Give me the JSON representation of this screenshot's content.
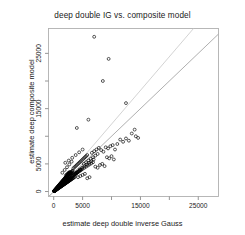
{
  "chart_data": {
    "type": "scatter",
    "title": "deep double IG vs. composite model",
    "xlabel": "estimate deep double inverse Gauss",
    "ylabel": "estimate deep composite model",
    "xlim": [
      -900,
      28500
    ],
    "ylim": [
      -900,
      29500
    ],
    "grid": false,
    "legend": null,
    "marker": "open-circle",
    "marker_color": "#000000",
    "xticks": [
      0,
      5000,
      10000,
      15000,
      20000,
      25000
    ],
    "xtick_labels": [
      "0",
      "5000",
      "",
      "15000",
      "",
      "25000"
    ],
    "yticks": [
      0,
      5000,
      10000,
      15000,
      20000,
      25000
    ],
    "ytick_labels": [
      "0",
      "5000",
      "",
      "15000",
      "",
      "25000"
    ],
    "reference_lines": [
      {
        "name": "identity-line",
        "slope": 1.0,
        "intercept": 0,
        "color": "#9a9a9a"
      },
      {
        "name": "fit-line",
        "slope": 1.22,
        "intercept": 0,
        "color": "#c8c8c8"
      }
    ],
    "points": [
      [
        60,
        55
      ],
      [
        90,
        80
      ],
      [
        110,
        95
      ],
      [
        130,
        120
      ],
      [
        150,
        130
      ],
      [
        170,
        160
      ],
      [
        190,
        175
      ],
      [
        210,
        195
      ],
      [
        230,
        210
      ],
      [
        250,
        235
      ],
      [
        270,
        250
      ],
      [
        290,
        265
      ],
      [
        310,
        290
      ],
      [
        330,
        300
      ],
      [
        350,
        325
      ],
      [
        370,
        340
      ],
      [
        390,
        360
      ],
      [
        410,
        380
      ],
      [
        430,
        395
      ],
      [
        450,
        415
      ],
      [
        470,
        430
      ],
      [
        490,
        455
      ],
      [
        510,
        470
      ],
      [
        530,
        490
      ],
      [
        550,
        505
      ],
      [
        570,
        525
      ],
      [
        590,
        545
      ],
      [
        610,
        560
      ],
      [
        630,
        580
      ],
      [
        650,
        600
      ],
      [
        670,
        615
      ],
      [
        690,
        635
      ],
      [
        710,
        650
      ],
      [
        730,
        670
      ],
      [
        750,
        690
      ],
      [
        770,
        705
      ],
      [
        790,
        725
      ],
      [
        810,
        745
      ],
      [
        830,
        760
      ],
      [
        850,
        780
      ],
      [
        870,
        800
      ],
      [
        890,
        815
      ],
      [
        910,
        835
      ],
      [
        930,
        855
      ],
      [
        950,
        870
      ],
      [
        970,
        890
      ],
      [
        990,
        910
      ],
      [
        1010,
        925
      ],
      [
        1030,
        945
      ],
      [
        1050,
        965
      ],
      [
        1080,
        985
      ],
      [
        1110,
        1010
      ],
      [
        1140,
        1035
      ],
      [
        1170,
        1060
      ],
      [
        1200,
        1085
      ],
      [
        1230,
        1110
      ],
      [
        1260,
        1140
      ],
      [
        1290,
        1165
      ],
      [
        1320,
        1190
      ],
      [
        1350,
        1215
      ],
      [
        1380,
        1240
      ],
      [
        1410,
        1265
      ],
      [
        1440,
        1290
      ],
      [
        1470,
        1320
      ],
      [
        1500,
        1345
      ],
      [
        1530,
        1370
      ],
      [
        1560,
        1395
      ],
      [
        1590,
        1420
      ],
      [
        1620,
        1445
      ],
      [
        1650,
        1470
      ],
      [
        1690,
        1500
      ],
      [
        1730,
        1530
      ],
      [
        1770,
        1560
      ],
      [
        1810,
        1590
      ],
      [
        1850,
        1620
      ],
      [
        1890,
        1650
      ],
      [
        1930,
        1680
      ],
      [
        1970,
        1710
      ],
      [
        2010,
        1740
      ],
      [
        2050,
        1775
      ],
      [
        2090,
        1805
      ],
      [
        2130,
        1835
      ],
      [
        2170,
        1865
      ],
      [
        2210,
        1895
      ],
      [
        2250,
        1925
      ],
      [
        2300,
        1960
      ],
      [
        2350,
        1995
      ],
      [
        2400,
        2030
      ],
      [
        2450,
        2070
      ],
      [
        2500,
        2105
      ],
      [
        2550,
        2140
      ],
      [
        2600,
        2175
      ],
      [
        2650,
        2215
      ],
      [
        2700,
        2250
      ],
      [
        2750,
        2285
      ],
      [
        2800,
        2320
      ],
      [
        2850,
        2360
      ],
      [
        2900,
        2395
      ],
      [
        2950,
        2430
      ],
      [
        3000,
        2470
      ],
      [
        120,
        150
      ],
      [
        200,
        245
      ],
      [
        280,
        340
      ],
      [
        360,
        435
      ],
      [
        440,
        530
      ],
      [
        520,
        625
      ],
      [
        600,
        720
      ],
      [
        680,
        815
      ],
      [
        760,
        910
      ],
      [
        840,
        1005
      ],
      [
        920,
        1100
      ],
      [
        1000,
        1195
      ],
      [
        1080,
        1290
      ],
      [
        1160,
        1385
      ],
      [
        1240,
        1480
      ],
      [
        1320,
        1575
      ],
      [
        1400,
        1670
      ],
      [
        1480,
        1765
      ],
      [
        1560,
        1860
      ],
      [
        1640,
        1955
      ],
      [
        1720,
        2050
      ],
      [
        1800,
        2145
      ],
      [
        1880,
        2240
      ],
      [
        1960,
        2335
      ],
      [
        2040,
        2430
      ],
      [
        2120,
        2525
      ],
      [
        2200,
        2620
      ],
      [
        2280,
        2715
      ],
      [
        2360,
        2810
      ],
      [
        2440,
        2905
      ],
      [
        2520,
        3000
      ],
      [
        2600,
        3095
      ],
      [
        2700,
        3190
      ],
      [
        2800,
        3290
      ],
      [
        2900,
        3390
      ],
      [
        3000,
        3490
      ],
      [
        3100,
        3590
      ],
      [
        3200,
        3690
      ],
      [
        3300,
        3790
      ],
      [
        150,
        110
      ],
      [
        250,
        180
      ],
      [
        350,
        255
      ],
      [
        450,
        325
      ],
      [
        550,
        400
      ],
      [
        650,
        470
      ],
      [
        750,
        545
      ],
      [
        850,
        615
      ],
      [
        950,
        690
      ],
      [
        1050,
        760
      ],
      [
        1150,
        835
      ],
      [
        1250,
        905
      ],
      [
        1350,
        980
      ],
      [
        1450,
        1050
      ],
      [
        1550,
        1125
      ],
      [
        1650,
        1195
      ],
      [
        1750,
        1270
      ],
      [
        1850,
        1340
      ],
      [
        1950,
        1415
      ],
      [
        2050,
        1485
      ],
      [
        2150,
        1560
      ],
      [
        2250,
        1630
      ],
      [
        2350,
        1705
      ],
      [
        2450,
        1775
      ],
      [
        2550,
        1850
      ],
      [
        2650,
        1920
      ],
      [
        2750,
        1995
      ],
      [
        2850,
        2065
      ],
      [
        2950,
        2140
      ],
      [
        3050,
        2210
      ],
      [
        3150,
        2285
      ],
      [
        3250,
        2355
      ],
      [
        3350,
        2430
      ],
      [
        3500,
        2530
      ],
      [
        3650,
        2640
      ],
      [
        100,
        70
      ],
      [
        180,
        130
      ],
      [
        260,
        190
      ],
      [
        340,
        250
      ],
      [
        420,
        310
      ],
      [
        500,
        370
      ],
      [
        580,
        430
      ],
      [
        660,
        490
      ],
      [
        740,
        550
      ],
      [
        820,
        610
      ],
      [
        900,
        670
      ],
      [
        980,
        730
      ],
      [
        1060,
        790
      ],
      [
        1140,
        850
      ],
      [
        1220,
        910
      ],
      [
        1300,
        970
      ],
      [
        1380,
        1030
      ],
      [
        1460,
        1090
      ],
      [
        1540,
        1150
      ],
      [
        1620,
        1210
      ],
      [
        1700,
        1270
      ],
      [
        1780,
        1330
      ],
      [
        1860,
        1390
      ],
      [
        1940,
        1450
      ],
      [
        2020,
        1510
      ],
      [
        2100,
        1570
      ],
      [
        2180,
        1630
      ],
      [
        2260,
        1690
      ],
      [
        2340,
        1750
      ],
      [
        2420,
        1810
      ],
      [
        2500,
        1870
      ],
      [
        2600,
        1945
      ],
      [
        2700,
        2020
      ],
      [
        80,
        100
      ],
      [
        160,
        200
      ],
      [
        240,
        300
      ],
      [
        320,
        400
      ],
      [
        400,
        500
      ],
      [
        480,
        600
      ],
      [
        560,
        700
      ],
      [
        640,
        800
      ],
      [
        720,
        900
      ],
      [
        800,
        1000
      ],
      [
        880,
        1100
      ],
      [
        960,
        1200
      ],
      [
        1040,
        1300
      ],
      [
        1120,
        1400
      ],
      [
        1200,
        1500
      ],
      [
        1280,
        1600
      ],
      [
        1360,
        1700
      ],
      [
        1440,
        1800
      ],
      [
        1520,
        1900
      ],
      [
        1600,
        2000
      ],
      [
        1700,
        2120
      ],
      [
        1800,
        2250
      ],
      [
        1900,
        2380
      ],
      [
        2000,
        2500
      ],
      [
        2100,
        2620
      ],
      [
        2200,
        2750
      ],
      [
        2300,
        2880
      ],
      [
        2400,
        3000
      ],
      [
        2500,
        3130
      ],
      [
        2600,
        3250
      ],
      [
        2700,
        3380
      ],
      [
        2800,
        3500
      ],
      [
        2100,
        2900
      ],
      [
        2250,
        3050
      ],
      [
        2400,
        3200
      ],
      [
        2550,
        3350
      ],
      [
        2700,
        3500
      ],
      [
        2850,
        3050
      ],
      [
        3000,
        3200
      ],
      [
        3150,
        3350
      ],
      [
        3300,
        2700
      ],
      [
        3450,
        2850
      ],
      [
        3600,
        3000
      ],
      [
        3750,
        3150
      ],
      [
        3900,
        3300
      ],
      [
        4050,
        3450
      ],
      [
        2300,
        2200
      ],
      [
        2500,
        2350
      ],
      [
        2700,
        2500
      ],
      [
        2900,
        2650
      ],
      [
        3100,
        2800
      ],
      [
        3300,
        2950
      ],
      [
        3500,
        3100
      ],
      [
        3700,
        3250
      ],
      [
        3900,
        3400
      ],
      [
        4100,
        3550
      ],
      [
        4300,
        3700
      ],
      [
        4500,
        3850
      ],
      [
        4700,
        4000
      ],
      [
        3400,
        4200
      ],
      [
        3600,
        4400
      ],
      [
        3800,
        4600
      ],
      [
        4000,
        4800
      ],
      [
        4200,
        5000
      ],
      [
        4400,
        5200
      ],
      [
        4600,
        5400
      ],
      [
        4800,
        5600
      ],
      [
        5000,
        5800
      ],
      [
        5200,
        6000
      ],
      [
        5400,
        6200
      ],
      [
        5600,
        6400
      ],
      [
        5800,
        6600
      ],
      [
        3800,
        3200
      ],
      [
        4000,
        3350
      ],
      [
        4200,
        3500
      ],
      [
        4400,
        3650
      ],
      [
        4600,
        3800
      ],
      [
        4800,
        3950
      ],
      [
        5000,
        4100
      ],
      [
        5300,
        4300
      ],
      [
        5600,
        4500
      ],
      [
        5900,
        4700
      ],
      [
        6200,
        4900
      ],
      [
        6500,
        5100
      ],
      [
        6800,
        5300
      ],
      [
        4200,
        2600
      ],
      [
        4600,
        2800
      ],
      [
        5000,
        3000
      ],
      [
        5400,
        3200
      ],
      [
        5800,
        2400
      ],
      [
        6200,
        2600
      ],
      [
        4500,
        4000
      ],
      [
        4900,
        4300
      ],
      [
        5300,
        4600
      ],
      [
        5700,
        4900
      ],
      [
        6100,
        5200
      ],
      [
        6500,
        5500
      ],
      [
        6900,
        5800
      ],
      [
        5200,
        5000
      ],
      [
        5600,
        5300
      ],
      [
        6000,
        5600
      ],
      [
        6400,
        5900
      ],
      [
        6800,
        6200
      ],
      [
        7200,
        6500
      ],
      [
        7600,
        6800
      ],
      [
        6600,
        7000
      ],
      [
        7000,
        7300
      ],
      [
        7400,
        7600
      ],
      [
        7800,
        7900
      ],
      [
        8200,
        7500
      ],
      [
        8600,
        7200
      ],
      [
        7200,
        4500
      ],
      [
        7600,
        4300
      ],
      [
        8000,
        4800
      ],
      [
        8400,
        5000
      ],
      [
        8800,
        4600
      ],
      [
        9000,
        8000
      ],
      [
        9400,
        7800
      ],
      [
        9800,
        8200
      ],
      [
        10200,
        8400
      ],
      [
        10600,
        7600
      ],
      [
        11000,
        8600
      ],
      [
        9200,
        6200
      ],
      [
        9600,
        6000
      ],
      [
        10000,
        6400
      ],
      [
        10400,
        5800
      ],
      [
        11500,
        9400
      ],
      [
        12000,
        9000
      ],
      [
        12500,
        9600
      ],
      [
        13000,
        9200
      ],
      [
        13500,
        10500
      ],
      [
        14000,
        11200
      ],
      [
        14200,
        10000
      ],
      [
        14600,
        9700
      ],
      [
        4000,
        11500
      ],
      [
        6000,
        13000
      ],
      [
        7000,
        28000
      ],
      [
        8500,
        20000
      ],
      [
        9500,
        24000
      ],
      [
        12500,
        16000
      ],
      [
        2000,
        5200
      ],
      [
        2600,
        5600
      ],
      [
        3200,
        6100
      ],
      [
        3800,
        6600
      ],
      [
        4400,
        7100
      ],
      [
        5000,
        7600
      ],
      [
        1500,
        3400
      ],
      [
        1900,
        3900
      ],
      [
        2300,
        4400
      ],
      [
        2700,
        4900
      ],
      [
        3100,
        5400
      ]
    ]
  }
}
